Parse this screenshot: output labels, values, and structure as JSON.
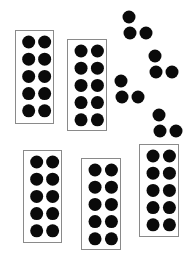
{
  "colors": {
    "background": "#ffffff",
    "dot": "#0a0a0a",
    "frame_border": "#8a8a8a"
  },
  "dot_diameter": 13,
  "ten_frames": [
    {
      "id": "frame-1",
      "x": 15,
      "y": 30,
      "w": 38,
      "h": 93,
      "columns": 2,
      "rows": 5,
      "filled": 10
    },
    {
      "id": "frame-2",
      "x": 67,
      "y": 39,
      "w": 39,
      "h": 91,
      "columns": 2,
      "rows": 5,
      "filled": 10
    },
    {
      "id": "frame-3",
      "x": 23,
      "y": 150,
      "w": 38,
      "h": 92,
      "columns": 2,
      "rows": 5,
      "filled": 10
    },
    {
      "id": "frame-4",
      "x": 81,
      "y": 158,
      "w": 39,
      "h": 91,
      "columns": 2,
      "rows": 5,
      "filled": 10
    },
    {
      "id": "frame-5",
      "x": 139,
      "y": 144,
      "w": 39,
      "h": 92,
      "columns": 2,
      "rows": 5,
      "filled": 10
    }
  ],
  "loose_dot_groups": [
    {
      "id": "group-1",
      "dots": [
        [
          129,
          17
        ],
        [
          130,
          33
        ],
        [
          146,
          33
        ]
      ]
    },
    {
      "id": "group-2",
      "dots": [
        [
          155,
          56
        ],
        [
          156,
          72
        ],
        [
          172,
          72
        ]
      ]
    },
    {
      "id": "group-3",
      "dots": [
        [
          121,
          81
        ],
        [
          122,
          97
        ],
        [
          138,
          97
        ]
      ]
    },
    {
      "id": "group-4",
      "dots": [
        [
          159,
          115
        ],
        [
          160,
          131
        ],
        [
          176,
          131
        ]
      ]
    }
  ],
  "summary": {
    "tens": 5,
    "ones": 12,
    "total": 62
  }
}
